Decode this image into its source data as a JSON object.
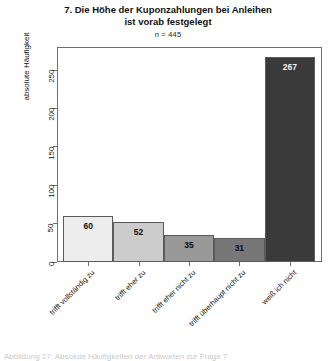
{
  "chart_data": {
    "type": "bar",
    "title": "7. Die Höhe der Kuponzahlungen bei Anleihen ist vorab festgelegt",
    "title_line1": "7. Die Höhe der Kuponzahlungen bei Anleihen",
    "title_line2": "ist vorab festgelegt",
    "subtitle": "n = 445",
    "xlabel": "",
    "ylabel": "absolute Häufigkeit",
    "ylim": [
      0,
      280
    ],
    "yticks": [
      0,
      50,
      100,
      150,
      200,
      250
    ],
    "ytick_labels": [
      "0",
      "50",
      "100",
      "150",
      "200",
      "250"
    ],
    "grid": false,
    "legend": "none",
    "categories": [
      "trifft vollständig zu",
      "trifft eher zu",
      "trifft eher nicht zu",
      "trifft überhaupt nicht zu",
      "weiß ich nicht"
    ],
    "values": [
      60,
      52,
      35,
      31,
      267
    ],
    "value_labels": [
      "60",
      "52",
      "35",
      "31",
      "267"
    ],
    "bar_colors": [
      "#ededed",
      "#cccccc",
      "#999999",
      "#777777",
      "#3a3a3a"
    ],
    "bar_border_color": "#5a5a5a",
    "label_text_colors": [
      "#0d0d0d",
      "#0d0d0d",
      "#0d0d0d",
      "#0d0d0d",
      "#f2f2f2"
    ]
  },
  "bottom_caption": {
    "text": "Abbildung 17: Absolute Häufigkeiten der Antworten zur Frage 7"
  }
}
